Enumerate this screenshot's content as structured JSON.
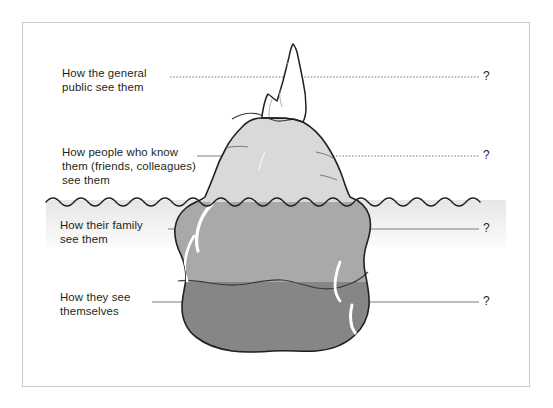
{
  "diagram": {
    "frame": {
      "border_color": "#c9c9c9"
    },
    "labels": [
      {
        "id": "public",
        "text": "How the general\npublic see them",
        "marker": "?"
      },
      {
        "id": "acquaintances",
        "text": "How people who know\nthem (friends, colleagues)\nsee them",
        "marker": "?"
      },
      {
        "id": "family",
        "text": "How their family\nsee them",
        "marker": "?"
      },
      {
        "id": "self",
        "text": "How they see\nthemselves",
        "marker": "?"
      }
    ],
    "iceberg": {
      "zones": [
        {
          "name": "peak-above-water",
          "fill": "#ffffff"
        },
        {
          "name": "body-above-water",
          "fill": "#d9d9d9"
        },
        {
          "name": "body-upper-underwater",
          "fill": "#a9a9a9"
        },
        {
          "name": "body-lower-underwater",
          "fill": "#868686"
        }
      ],
      "outline_color": "#231f20",
      "highlight_color": "#ffffff"
    },
    "water": {
      "name": "waterline",
      "wave_color": "#231f20",
      "band_top_fill": "#e8e8e8",
      "band_bottom_fill": "#fbfbfb"
    },
    "leader_lines": {
      "dotted_color": "#6f6f6f",
      "solid_color": "#6f6f6f"
    }
  }
}
